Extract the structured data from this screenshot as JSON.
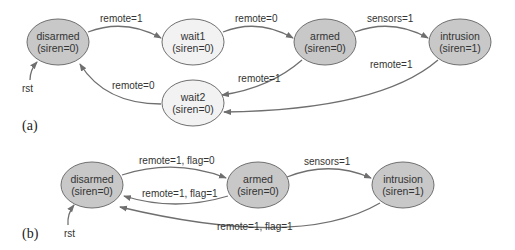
{
  "diagram_a": {
    "panel_label": "(a)",
    "states": {
      "disarmed": {
        "name": "disarmed",
        "output": "(siren=0)",
        "fill": "#c8c8c8"
      },
      "wait1": {
        "name": "wait1",
        "output": "(siren=0)",
        "fill": "#f2f2f2"
      },
      "armed": {
        "name": "armed",
        "output": "(siren=0)",
        "fill": "#c8c8c8"
      },
      "intrusion": {
        "name": "intrusion",
        "output": "(siren=1)",
        "fill": "#c8c8c8"
      },
      "wait2": {
        "name": "wait2",
        "output": "(siren=0)",
        "fill": "#f2f2f2"
      }
    },
    "transitions": {
      "disarmed_wait1": "remote=1",
      "wait1_armed": "remote=0",
      "armed_intrusion": "sensors=1",
      "armed_wait2": "remote=1",
      "intrusion_wait2": "remote=1",
      "wait2_disarmed": "remote=0"
    },
    "reset_label": "rst"
  },
  "diagram_b": {
    "panel_label": "(b)",
    "states": {
      "disarmed": {
        "name": "disarmed",
        "output": "(siren=0)",
        "fill": "#c8c8c8"
      },
      "armed": {
        "name": "armed",
        "output": "(siren=0)",
        "fill": "#c8c8c8"
      },
      "intrusion": {
        "name": "intrusion",
        "output": "(siren=1)",
        "fill": "#c8c8c8"
      }
    },
    "transitions": {
      "disarmed_armed": "remote=1, flag=0",
      "armed_disarmed": "remote=1, flag=1",
      "armed_intrusion": "sensors=1",
      "intrusion_disarmed": "remote=1, flag=1"
    },
    "reset_label": "rst"
  }
}
